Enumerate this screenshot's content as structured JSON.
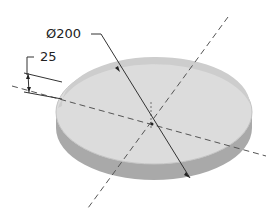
{
  "drawing": {
    "title": "Disc with diameter and thickness dimensions",
    "shape": "cylinder-disc",
    "colors": {
      "top_face": "#dcdcdc",
      "side_face": "#a9a9a9",
      "rim": "#c8c8c8",
      "lines": "#333333",
      "centerlines": "#555555"
    },
    "dimensions": {
      "diameter_symbol": "Ø",
      "diameter_value": "200",
      "diameter_label": "Ø200",
      "thickness_value": "25"
    }
  }
}
